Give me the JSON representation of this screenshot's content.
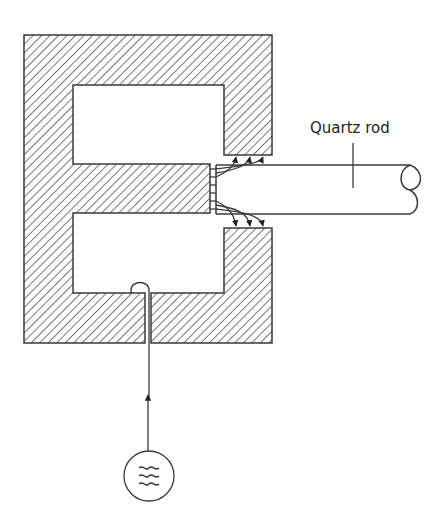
{
  "diagram": {
    "labels": {
      "quartz_rod": "Quartz rod"
    },
    "components": {
      "yoke": "E-shaped magnetic core (hatched)",
      "rod": "Quartz rod",
      "coil_wire": "Drive wire loop through core slot",
      "source": "AC oscillator"
    },
    "source_symbol": "≈",
    "colors": {
      "stroke": "#3a3a3a",
      "hatch": "#555555",
      "background": "#ffffff"
    }
  }
}
